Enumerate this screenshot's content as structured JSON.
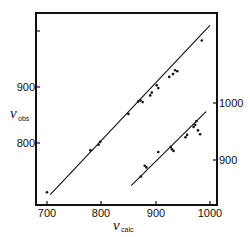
{
  "chart_data": {
    "type": "scatter",
    "title": "",
    "xlabel": "ν_calc",
    "ylabel": "ν_obs",
    "x_symbol": "ν",
    "x_subscript": "calc",
    "y_symbol": "ν",
    "y_subscript": "obs",
    "xlim": [
      680,
      1013
    ],
    "x_ticks": [
      700,
      800,
      900,
      1000
    ],
    "left_axis": {
      "ylim": [
        690,
        1035
      ],
      "ticks": [
        800,
        900,
        1000
      ],
      "tick_labels": [
        "800",
        "900"
      ]
    },
    "right_axis": {
      "ylim": [
        820,
        1095
      ],
      "ticks": [
        900,
        1000
      ],
      "tick_labels": [
        "900",
        "1000"
      ]
    },
    "grid": false,
    "legend": null,
    "series": [
      {
        "name": "upper set (left axis)",
        "axis": "left",
        "fit_line": {
          "x": [
            706,
            1000
          ],
          "y": [
            708,
            1010
          ]
        },
        "points": [
          {
            "x": 700,
            "y": 712
          },
          {
            "x": 780,
            "y": 787
          },
          {
            "x": 795,
            "y": 797
          },
          {
            "x": 798,
            "y": 802
          },
          {
            "x": 850,
            "y": 852
          },
          {
            "x": 868,
            "y": 874
          },
          {
            "x": 872,
            "y": 876
          },
          {
            "x": 876,
            "y": 873
          },
          {
            "x": 890,
            "y": 885
          },
          {
            "x": 893,
            "y": 890
          },
          {
            "x": 902,
            "y": 903
          },
          {
            "x": 905,
            "y": 898
          },
          {
            "x": 925,
            "y": 918
          },
          {
            "x": 932,
            "y": 923
          },
          {
            "x": 936,
            "y": 930
          },
          {
            "x": 940,
            "y": 928
          },
          {
            "x": 985,
            "y": 983
          }
        ]
      },
      {
        "name": "lower set (right axis)",
        "axis": "right",
        "fit_line": {
          "x": [
            855,
            993
          ],
          "y": [
            855,
            985
          ]
        },
        "points": [
          {
            "x": 873,
            "y": 871
          },
          {
            "x": 880,
            "y": 890
          },
          {
            "x": 883,
            "y": 887
          },
          {
            "x": 905,
            "y": 914
          },
          {
            "x": 928,
            "y": 923
          },
          {
            "x": 930,
            "y": 919
          },
          {
            "x": 933,
            "y": 916
          },
          {
            "x": 955,
            "y": 940
          },
          {
            "x": 958,
            "y": 944
          },
          {
            "x": 970,
            "y": 958
          },
          {
            "x": 973,
            "y": 962
          },
          {
            "x": 975,
            "y": 968
          },
          {
            "x": 978,
            "y": 952
          },
          {
            "x": 982,
            "y": 945
          }
        ]
      }
    ]
  },
  "labels": {
    "x_ticks": [
      "700",
      "800",
      "900",
      "1000"
    ],
    "left_ticks": [
      "800",
      "900"
    ],
    "right_ticks": [
      "900",
      "1000"
    ],
    "x_symbol": "ν",
    "x_sub": "calc",
    "y_symbol": "ν",
    "y_sub": "obs"
  }
}
